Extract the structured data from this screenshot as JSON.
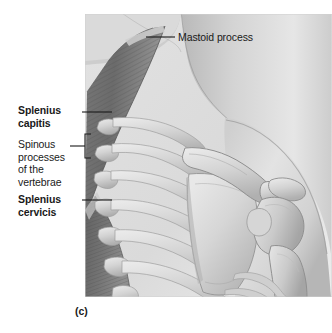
{
  "figure": {
    "caption": "(c)",
    "panel_background": "#dcdcdc",
    "page_background": "#ffffff"
  },
  "labels": {
    "mastoid_process": "Mastoid process",
    "splenius_capitis": "Splenius\ncapitis",
    "spinous_processes": "Spinous\nprocesses\nof the\nvertebrae",
    "splenius_cervicis": "Splenius\ncervicis"
  },
  "illustration": {
    "subject": "posterior view of neck and shoulder musculature and skeleton",
    "structures": [
      "head",
      "neck",
      "mastoid process",
      "splenius capitis muscle",
      "splenius cervicis muscle",
      "cervical vertebrae spinous processes",
      "thoracic vertebrae",
      "ribs",
      "scapula",
      "spine of scapula",
      "acromion",
      "clavicle",
      "humerus head",
      "humerus shaft",
      "shoulder soft tissue contour"
    ],
    "colors": {
      "background": "#dcdcdc",
      "bone_light": "#dfdfdf",
      "bone_mid": "#c4c4c4",
      "bone_shadow": "#9d9d9d",
      "muscle_dark": "#6f6f6f",
      "muscle_mid": "#8a8a8a",
      "muscle_striation": "#5a5a5a",
      "skin_light": "#d2d2d2",
      "skin_shadow": "#ababab",
      "outline": "#6a6a6a"
    }
  }
}
